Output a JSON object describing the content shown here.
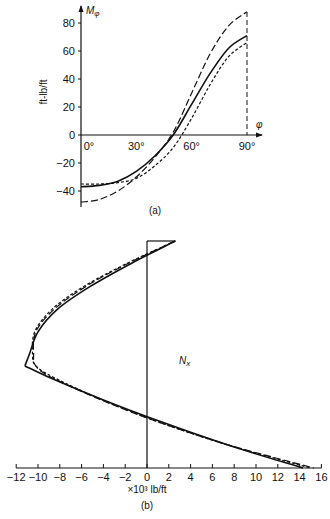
{
  "chart_data": [
    {
      "id": "a",
      "type": "line",
      "caption": "(a)",
      "title": "",
      "xlabel": "φ",
      "ylabel": "ft-lb/ft",
      "y_symbol": "Mφ",
      "xlim": [
        0,
        90
      ],
      "ylim": [
        -50,
        90
      ],
      "x_ticks": [
        "0°",
        "30°",
        "60°",
        "90°"
      ],
      "x_tick_values": [
        0,
        30,
        60,
        90
      ],
      "y_ticks": [
        "80",
        "60",
        "40",
        "20",
        "0",
        "-20",
        "-40"
      ],
      "y_tick_values": [
        80,
        60,
        40,
        20,
        0,
        -20,
        -40
      ],
      "grid": false,
      "legend": "none",
      "x": [
        0,
        10,
        20,
        30,
        40,
        50,
        60,
        70,
        80,
        90
      ],
      "series": [
        {
          "name": "solid",
          "style": "solid",
          "values": [
            -37,
            -36,
            -33,
            -26,
            -15,
            0,
            22,
            44,
            62,
            71
          ]
        },
        {
          "name": "long-dash",
          "style": "long-dash",
          "values": [
            -48,
            -46,
            -40,
            -30,
            -16,
            2,
            30,
            58,
            78,
            88
          ]
        },
        {
          "name": "short-dash",
          "style": "short-dash",
          "values": [
            -35,
            -35,
            -34,
            -31,
            -22,
            -9,
            12,
            36,
            56,
            66
          ]
        }
      ],
      "annotations": [
        "dashed vertical line at 90°"
      ]
    },
    {
      "id": "b",
      "type": "line",
      "caption": "(b)",
      "title": "",
      "label": "Nx",
      "xlabel": "×10³ lb/ft",
      "ylabel": "",
      "xlim": [
        -12,
        16
      ],
      "x_ticks": [
        "-12",
        "-10",
        "-8",
        "-6",
        "-4",
        "-2",
        "0",
        "2",
        "4",
        "6",
        "8",
        "10",
        "12",
        "14",
        "16"
      ],
      "grid": false,
      "legend": "none",
      "position": [
        0,
        0.1,
        0.2,
        0.3,
        0.4,
        0.5,
        0.55,
        0.6,
        0.7,
        0.8,
        0.9,
        1.0
      ],
      "series": [
        {
          "name": "solid",
          "style": "solid",
          "values": [
            2.6,
            -1.5,
            -5.2,
            -8.2,
            -10.0,
            -10.8,
            -11.2,
            -9.0,
            -4.0,
            1.5,
            7.5,
            14.3
          ]
        },
        {
          "name": "long-dash",
          "style": "long-dash",
          "values": [
            2.6,
            -1.8,
            -5.6,
            -8.5,
            -10.2,
            -10.4,
            -10.2,
            -8.8,
            -4.2,
            1.2,
            7.6,
            15.3
          ]
        },
        {
          "name": "short-dash",
          "style": "short-dash",
          "values": [
            2.6,
            -1.9,
            -5.8,
            -8.7,
            -10.3,
            -10.5,
            -10.2,
            -8.6,
            -4.1,
            1.2,
            7.5,
            15.0
          ]
        }
      ]
    }
  ],
  "labels": {
    "a_ylabel": "ft-lb/ft",
    "a_ysym": "M",
    "a_ysub": "φ",
    "a_xsym": "φ",
    "a_caption": "(a)",
    "b_nx": "N",
    "b_nx_sub": "x",
    "b_xlabel": "×10³ lb/ft",
    "b_caption": "(b)"
  }
}
